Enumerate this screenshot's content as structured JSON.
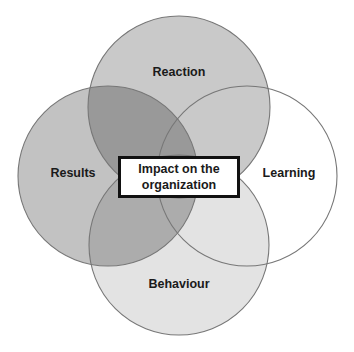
{
  "diagram": {
    "type": "venn",
    "circles": [
      {
        "id": "reaction",
        "label": "Reaction",
        "fill": "#c9c9c9"
      },
      {
        "id": "results",
        "label": "Results",
        "fill": "#c3c3c3"
      },
      {
        "id": "learning",
        "label": "Learning",
        "fill": "#ffffff"
      },
      {
        "id": "behaviour",
        "label": "Behaviour",
        "fill": "#e3e3e3"
      }
    ],
    "center": {
      "line1": "Impact on the",
      "line2": "organization"
    },
    "stroke_color": "#777777"
  }
}
